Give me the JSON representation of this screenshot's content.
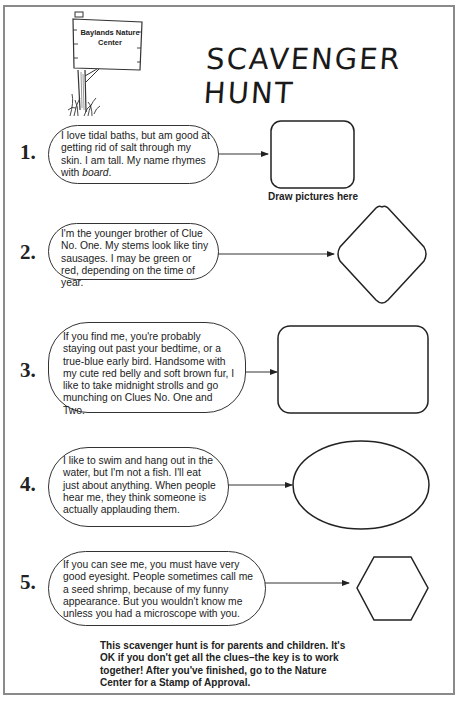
{
  "sign": {
    "line1": "Baylands Nature",
    "line2": "Center",
    "icon": "wooden-signpost-icon"
  },
  "title": "SCAVENGER HUNT",
  "draw_label": "Draw pictures here",
  "clues": [
    {
      "number": "1.",
      "text_before": "I love tidal baths, but am good at getting rid of salt through my skin. I am tall. My name rhymes with ",
      "text_italic": "board",
      "text_after": ".",
      "shape": "rounded-square"
    },
    {
      "number": "2.",
      "text": "I'm the younger brother of Clue No. One. My stems look like tiny sausages. I may be green or red, depending on the time of year.",
      "shape": "diamond"
    },
    {
      "number": "3.",
      "text": "If you find me, you're probably staying out past your bedtime, or a true-blue early bird. Handsome with my cute red belly and soft brown fur, I like to take midnight strolls and go munching on Clues No. One and Two.",
      "shape": "rounded-rectangle"
    },
    {
      "number": "4.",
      "text": "I like to swim and hang out in the water, but I'm not a fish. I'll eat just about anything. When people hear me, they think someone is actually applauding them.",
      "shape": "ellipse"
    },
    {
      "number": "5.",
      "text": "If you can see me, you must have very good eyesight. People sometimes call me a seed shrimp, because of my funny appearance. But you wouldn't know me unless you had a microscope with you.",
      "shape": "hexagon"
    }
  ],
  "footer": "This scavenger hunt is for parents and children. It's OK if you don't get all the clues–the key is to work together! After you've finished, go to the Nature Center for a Stamp of Approval.",
  "colors": {
    "ink": "#1a1a1a",
    "border": "#8a8a8a",
    "background": "#ffffff"
  }
}
